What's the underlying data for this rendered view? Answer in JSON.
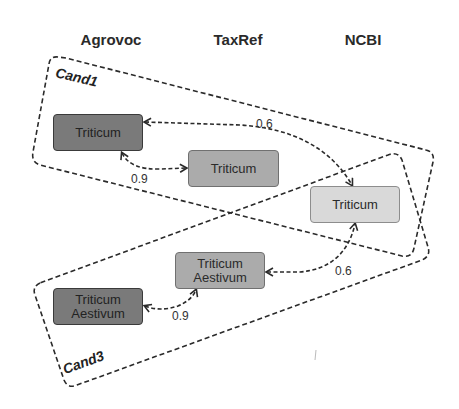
{
  "columns": [
    {
      "label": "Agrovoc"
    },
    {
      "label": "TaxRef"
    },
    {
      "label": "NCBI"
    }
  ],
  "candidates": [
    {
      "label": "Cand1"
    },
    {
      "label": "Cand3"
    }
  ],
  "nodes": [
    {
      "id": "agrovoc-triticum",
      "source": "Agrovoc",
      "lines": [
        "Triticum"
      ],
      "shade": "dark"
    },
    {
      "id": "taxref-triticum",
      "source": "TaxRef",
      "lines": [
        "Triticum"
      ],
      "shade": "mid"
    },
    {
      "id": "ncbi-triticum",
      "source": "NCBI",
      "lines": [
        "Triticum"
      ],
      "shade": "light"
    },
    {
      "id": "taxref-triticum-aestivum",
      "source": "TaxRef",
      "lines": [
        "Triticum",
        "Aestivum"
      ],
      "shade": "mid"
    },
    {
      "id": "agrovoc-triticum-aestivum",
      "source": "Agrovoc",
      "lines": [
        "Triticum",
        "Aestivum"
      ],
      "shade": "dark"
    }
  ],
  "edges": [
    {
      "from": "agrovoc-triticum",
      "to": "taxref-triticum",
      "score": "0.9"
    },
    {
      "from": "agrovoc-triticum",
      "to": "ncbi-triticum",
      "score": "0.6"
    },
    {
      "from": "agrovoc-triticum-aestivum",
      "to": "taxref-triticum-aestivum",
      "score": "0.9"
    },
    {
      "from": "taxref-triticum-aestivum",
      "to": "ncbi-triticum",
      "score": "0.6"
    }
  ],
  "colors": {
    "dark_node": "#7a7a7a",
    "mid_node": "#ababab",
    "light_node": "#d9d9d9",
    "line": "#2a2a2a"
  }
}
